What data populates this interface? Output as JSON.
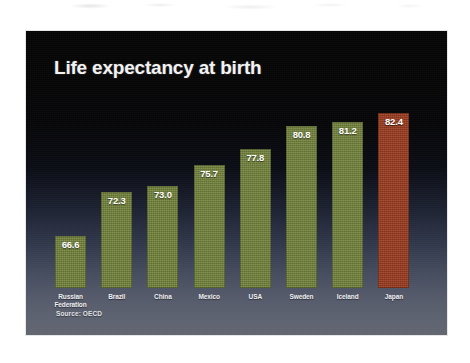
{
  "slide": {
    "title": "Life expectancy at birth",
    "source_note": "Source: OECD",
    "background_top_color": "#050505",
    "background_bottom_color": "#61656f"
  },
  "chart_data": {
    "type": "bar",
    "title": "Life expectancy at birth",
    "xlabel": "",
    "ylabel": "",
    "ylim": [
      0,
      86
    ],
    "grid": false,
    "legend": false,
    "annotations": [
      "Source: OECD"
    ],
    "categories": [
      "Russian Federation",
      "Brazil",
      "China",
      "Mexico",
      "USA",
      "Sweden",
      "Iceland",
      "Japan"
    ],
    "values": [
      66.6,
      72.3,
      73.0,
      75.7,
      77.8,
      80.8,
      81.2,
      82.4
    ],
    "value_labels": [
      "66.6",
      "72.3",
      "73.0",
      "75.7",
      "77.8",
      "80.8",
      "81.2",
      "82.4"
    ],
    "bar_colors": [
      "#74843c",
      "#74843c",
      "#74843c",
      "#74843c",
      "#74843c",
      "#74843c",
      "#74843c",
      "#9c3a1e"
    ],
    "highlight_category": "Japan",
    "highlight_color": "#9c3a1e",
    "series_color": "#74843c"
  }
}
